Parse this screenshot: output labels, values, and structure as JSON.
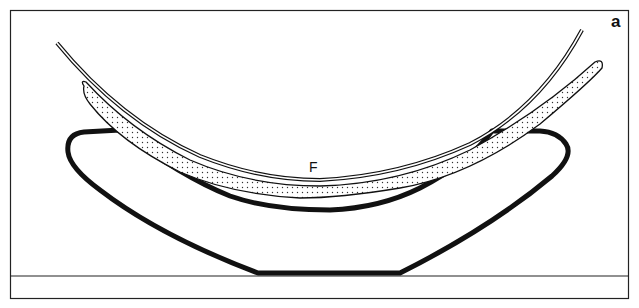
{
  "figure": {
    "panel_label": "a",
    "curve_label": "F",
    "colors": {
      "ink": "#111111",
      "background": "#ffffff",
      "stipple": "#333333"
    },
    "elements": [
      {
        "name": "outer-frame",
        "description": "rectangular border"
      },
      {
        "name": "base-line",
        "description": "horizontal ground line near bottom"
      },
      {
        "name": "thick-support-outline",
        "description": "heavy black boat-shaped outline"
      },
      {
        "name": "stippled-band",
        "description": "dotted crescent layer"
      },
      {
        "name": "thin-curve-F",
        "description": "thin double-line curved film labeled F"
      }
    ]
  }
}
